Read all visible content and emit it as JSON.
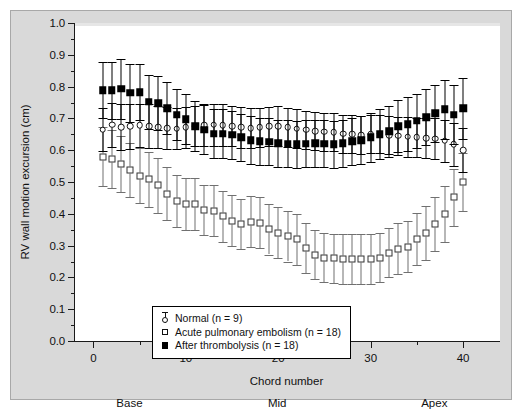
{
  "figure": {
    "background_color": "#d9d9d9",
    "panel_color": "#ffffff",
    "border_color": "#a8a8a8"
  },
  "axes": {
    "y_title": "RV wall motion excursion (cm)",
    "x_title": "Chord number",
    "y_ticks": [
      "0.0",
      "0.1",
      "0.2",
      "0.3",
      "0.4",
      "0.5",
      "0.6",
      "0.7",
      "0.8",
      "0.9",
      "1.0"
    ],
    "x_ticks": [
      "0",
      "10",
      "20",
      "30",
      "40"
    ],
    "region_labels": [
      {
        "text": "Base",
        "chord": 4
      },
      {
        "text": "Mid",
        "chord": 20
      },
      {
        "text": "Apex",
        "chord": 37
      }
    ]
  },
  "legend": {
    "items": [
      {
        "label": "Normal (n = 9)",
        "marker": "open-circle-with-errorbar",
        "key_name": "legend-key-normal"
      },
      {
        "label": "Acute pulmonary embolism (n = 18)",
        "marker": "open-square",
        "key_name": "legend-key-ape"
      },
      {
        "label": "After thrombolysis (n = 18)",
        "marker": "filled-square",
        "key_name": "legend-key-thrombolysis"
      }
    ]
  },
  "chart_data": {
    "type": "scatter",
    "title": "",
    "xlabel": "Chord number",
    "ylabel": "RV wall motion excursion (cm)",
    "xlim": [
      -2,
      44
    ],
    "ylim": [
      0.0,
      1.0
    ],
    "grid": false,
    "legend_position": "lower-left-inside",
    "error_bars": "vertical, symmetric (SD)",
    "x": [
      1,
      2,
      3,
      4,
      5,
      6,
      7,
      8,
      9,
      10,
      11,
      12,
      13,
      14,
      15,
      16,
      17,
      18,
      19,
      20,
      21,
      22,
      23,
      24,
      25,
      26,
      27,
      28,
      29,
      30,
      31,
      32,
      33,
      34,
      35,
      36,
      37,
      38,
      39,
      40
    ],
    "series": [
      {
        "name": "Normal (n = 9)",
        "marker": "open-circle",
        "color": "#111111",
        "values": [
          0.665,
          0.68,
          0.672,
          0.675,
          0.678,
          0.676,
          0.672,
          0.67,
          0.668,
          0.672,
          0.676,
          0.678,
          0.68,
          0.678,
          0.676,
          0.672,
          0.67,
          0.672,
          0.675,
          0.676,
          0.672,
          0.668,
          0.664,
          0.66,
          0.658,
          0.656,
          0.652,
          0.65,
          0.648,
          0.65,
          0.652,
          0.648,
          0.645,
          0.642,
          0.64,
          0.638,
          0.636,
          0.63,
          0.618,
          0.6
        ],
        "err": [
          0.068,
          0.07,
          0.072,
          0.07,
          0.068,
          0.068,
          0.066,
          0.066,
          0.064,
          0.064,
          0.064,
          0.066,
          0.066,
          0.066,
          0.064,
          0.064,
          0.062,
          0.062,
          0.062,
          0.062,
          0.062,
          0.062,
          0.06,
          0.06,
          0.06,
          0.06,
          0.06,
          0.06,
          0.06,
          0.06,
          0.06,
          0.06,
          0.06,
          0.062,
          0.062,
          0.064,
          0.064,
          0.066,
          0.068,
          0.07
        ]
      },
      {
        "name": "Acute pulmonary embolism (n = 18)",
        "marker": "open-square",
        "color": "#707070",
        "values": [
          0.58,
          0.572,
          0.556,
          0.538,
          0.52,
          0.508,
          0.49,
          0.463,
          0.44,
          0.432,
          0.43,
          0.412,
          0.41,
          0.392,
          0.378,
          0.368,
          0.375,
          0.372,
          0.352,
          0.34,
          0.33,
          0.32,
          0.292,
          0.272,
          0.262,
          0.26,
          0.258,
          0.258,
          0.258,
          0.258,
          0.262,
          0.278,
          0.29,
          0.296,
          0.32,
          0.34,
          0.368,
          0.4,
          0.452,
          0.5
        ],
        "err": [
          0.092,
          0.09,
          0.088,
          0.086,
          0.086,
          0.086,
          0.086,
          0.084,
          0.082,
          0.082,
          0.082,
          0.08,
          0.08,
          0.08,
          0.08,
          0.08,
          0.08,
          0.08,
          0.08,
          0.08,
          0.08,
          0.08,
          0.078,
          0.078,
          0.078,
          0.078,
          0.078,
          0.078,
          0.078,
          0.078,
          0.078,
          0.078,
          0.08,
          0.08,
          0.082,
          0.084,
          0.086,
          0.088,
          0.09,
          0.092
        ]
      },
      {
        "name": "After thrombolysis (n = 18)",
        "marker": "filled-square",
        "color": "#000000",
        "values": [
          0.788,
          0.788,
          0.793,
          0.78,
          0.782,
          0.752,
          0.748,
          0.732,
          0.712,
          0.698,
          0.676,
          0.665,
          0.652,
          0.652,
          0.648,
          0.64,
          0.632,
          0.628,
          0.626,
          0.622,
          0.62,
          0.618,
          0.62,
          0.622,
          0.62,
          0.618,
          0.622,
          0.628,
          0.632,
          0.64,
          0.65,
          0.66,
          0.676,
          0.682,
          0.692,
          0.704,
          0.716,
          0.728,
          0.712,
          0.732
        ],
        "err": [
          0.088,
          0.09,
          0.095,
          0.09,
          0.088,
          0.086,
          0.084,
          0.082,
          0.08,
          0.08,
          0.078,
          0.078,
          0.078,
          0.076,
          0.076,
          0.074,
          0.074,
          0.074,
          0.074,
          0.074,
          0.074,
          0.074,
          0.074,
          0.074,
          0.074,
          0.074,
          0.074,
          0.074,
          0.076,
          0.076,
          0.078,
          0.08,
          0.082,
          0.084,
          0.086,
          0.088,
          0.09,
          0.092,
          0.094,
          0.096
        ]
      }
    ]
  }
}
